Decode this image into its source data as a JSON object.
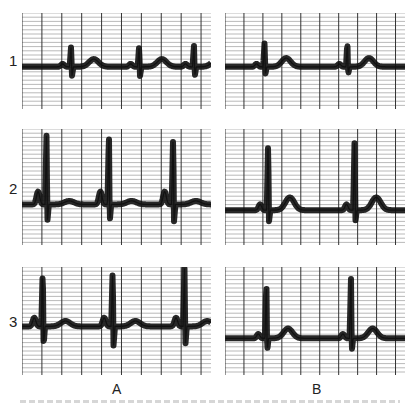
{
  "figure": {
    "row_labels": [
      "1",
      "2",
      "3"
    ],
    "column_labels": [
      "A",
      "B"
    ],
    "panels": [
      {
        "id": "A1",
        "row": 1,
        "col": "A",
        "x": 22,
        "y": 13,
        "w": 189,
        "h": 96,
        "baseline": 0.56,
        "beats": [
          0.26,
          0.62,
          0.91
        ],
        "qrs_height": 0.22,
        "qrs_depth": 0.1,
        "t_height": 0.08,
        "p_height": 0.03,
        "tail": "T wave after each QRS"
      },
      {
        "id": "B1",
        "row": 1,
        "col": "B",
        "x": 225,
        "y": 13,
        "w": 180,
        "h": 96,
        "baseline": 0.56,
        "beats": [
          0.22,
          0.68
        ],
        "qrs_height": 0.26,
        "qrs_depth": 0.08,
        "t_height": 0.09,
        "p_height": 0.03,
        "tail": "T wave after each QRS"
      },
      {
        "id": "A2",
        "row": 2,
        "col": "A",
        "x": 22,
        "y": 129,
        "w": 189,
        "h": 116,
        "baseline": 0.65,
        "beats": [
          0.13,
          0.46,
          0.8
        ],
        "qrs_height": 0.62,
        "qrs_depth": 0.15,
        "t_height": 0.03,
        "p_height": 0.11,
        "tail": "large R peaks with preceding P"
      },
      {
        "id": "B2",
        "row": 2,
        "col": "B",
        "x": 225,
        "y": 129,
        "w": 180,
        "h": 116,
        "baseline": 0.7,
        "beats": [
          0.24,
          0.72
        ],
        "qrs_height": 0.62,
        "qrs_depth": 0.1,
        "t_height": 0.11,
        "p_height": 0.05,
        "tail": "large R peaks with T wave"
      },
      {
        "id": "A3",
        "row": 3,
        "col": "A",
        "x": 22,
        "y": 267,
        "w": 189,
        "h": 108,
        "baseline": 0.55,
        "beats": [
          0.11,
          0.48,
          0.86
        ],
        "qrs_height": 0.55,
        "qrs_depth": 0.18,
        "t_height": 0.05,
        "p_height": 0.08,
        "tail": "large R peaks"
      },
      {
        "id": "B3",
        "row": 3,
        "col": "B",
        "x": 225,
        "y": 267,
        "w": 180,
        "h": 108,
        "baseline": 0.66,
        "beats": [
          0.23,
          0.7
        ],
        "qrs_height": 0.55,
        "qrs_depth": 0.12,
        "t_height": 0.09,
        "p_height": 0.04,
        "tail": "large R peaks with T wave"
      }
    ],
    "grid": {
      "major_spacing": 20,
      "minor_spacing": 5,
      "major_color": "#333333",
      "minor_color": "#8a8a8a",
      "trace_color": "#111111"
    }
  }
}
